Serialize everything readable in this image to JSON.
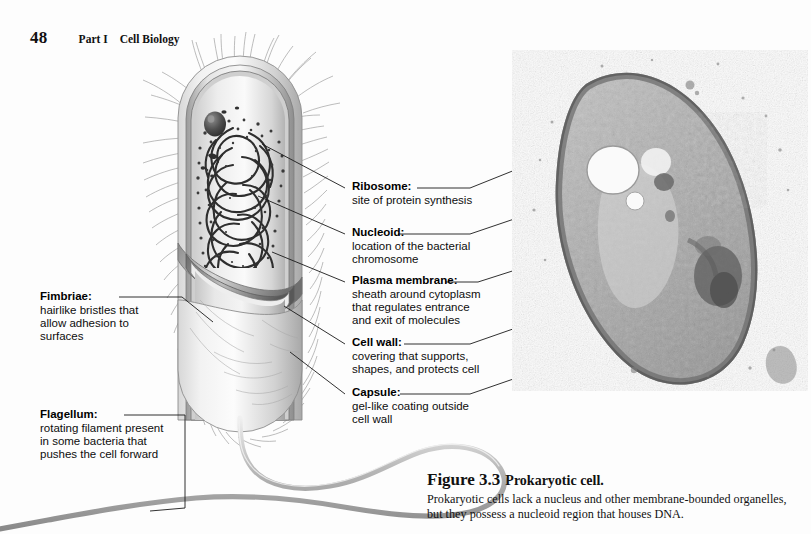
{
  "page": {
    "folio": "48",
    "part": "Part I",
    "subject": "Cell Biology",
    "background_color": "#fdfdfd",
    "text_color": "#000000"
  },
  "figure": {
    "number": "Figure 3.3",
    "title": "Prokaryotic cell.",
    "caption_line1": "Prokaryotic cells lack a nucleus and other membrane-bounded organelles,",
    "caption_line2": "but they possess a nucleoid region that houses DNA."
  },
  "micrograph": {
    "alt": "transmission electron micrograph of a prokaryotic bacterial cell",
    "tone": "grayscale"
  },
  "labels": {
    "ribosome": {
      "lead": "Ribosome:",
      "desc": [
        "site of protein synthesis"
      ]
    },
    "nucleoid": {
      "lead": "Nucleoid:",
      "desc": [
        "location of the bacterial",
        "chromosome"
      ]
    },
    "plasma_membrane": {
      "lead": "Plasma membrane:",
      "desc": [
        "sheath around cytoplasm",
        "that regulates entrance",
        "and exit of molecules"
      ]
    },
    "cell_wall": {
      "lead": "Cell wall:",
      "desc": [
        "covering that supports,",
        "shapes, and protects cell"
      ]
    },
    "capsule": {
      "lead": "Capsule:",
      "desc": [
        "gel-like coating outside",
        "cell wall"
      ]
    },
    "fimbriae": {
      "lead": "Fimbriae:",
      "desc": [
        "hairlike bristles that",
        "allow adhesion to",
        "surfaces"
      ]
    },
    "flagellum": {
      "lead": "Flagellum:",
      "desc": [
        "rotating filament present",
        "in some bacteria that",
        "pushes the cell forward"
      ]
    }
  }
}
